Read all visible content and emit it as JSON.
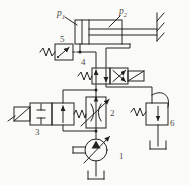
{
  "diagram_type": "hydraulic-circuit-schematic",
  "colors": {
    "line": "#222222",
    "label": "#4a4a4a",
    "background": "#fafaf8"
  },
  "labels": {
    "p1_base": "p",
    "p1_sub": "1",
    "p2_base": "p",
    "p2_sub": "2",
    "pump": "1",
    "flow_valve": "2",
    "bypass_valve": "3",
    "directional_valve": "4",
    "pressure_switch": "5",
    "backpressure_valve": "6"
  },
  "components": [
    {
      "label": "1",
      "name": "variable-displacement-pump"
    },
    {
      "label": "2",
      "name": "variable-throttle-valve"
    },
    {
      "label": "3",
      "name": "two-way-solenoid-bypass-valve"
    },
    {
      "label": "4",
      "name": "four-way-solenoid-directional-valve"
    },
    {
      "label": "5",
      "name": "pressure-switch"
    },
    {
      "label": "6",
      "name": "back-pressure-relief-valve"
    },
    {
      "label": "p1",
      "name": "cylinder-cap-end-pressure"
    },
    {
      "label": "p2",
      "name": "cylinder-rod-end-pressure"
    }
  ]
}
